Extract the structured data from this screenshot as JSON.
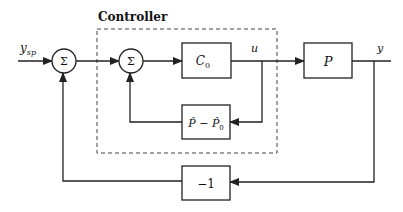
{
  "diagram": {
    "type": "block-diagram",
    "controller_label": "Controller",
    "input_label": "y",
    "input_subscript": "sp",
    "summing_junction_symbol": "Σ",
    "blocks": {
      "c0": {
        "main": "C",
        "sub": "0"
      },
      "plant": {
        "main": "P"
      },
      "model_diff": {
        "a": "P̂",
        "minus": " − ",
        "b": "P̂",
        "b_sub": "0"
      },
      "negation": {
        "main": "−1"
      }
    },
    "signals": {
      "control": "u",
      "output": "y"
    },
    "colors": {
      "stroke": "#222222",
      "background": "#ffffff"
    }
  }
}
